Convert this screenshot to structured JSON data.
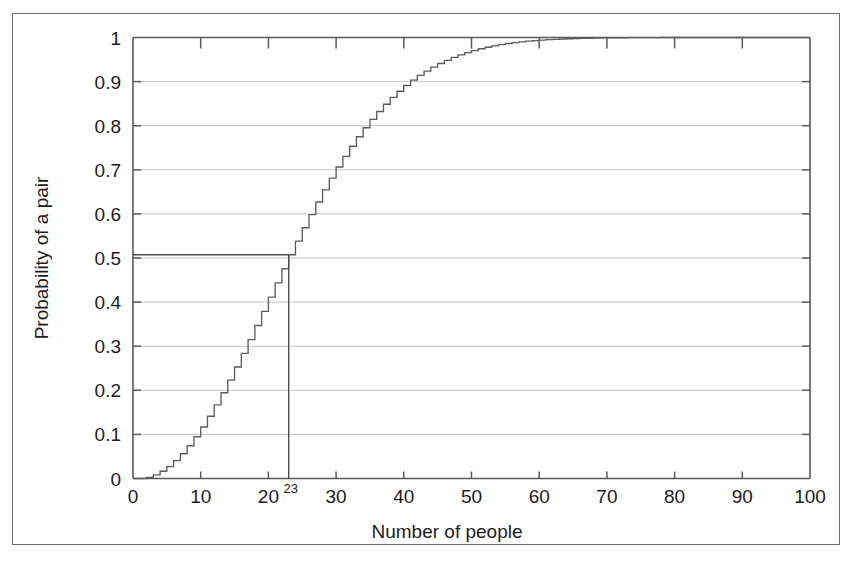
{
  "figure": {
    "frame_border_color": "#6b6b6b",
    "background_color": "#ffffff",
    "axis_color": "#5a5a5a",
    "grid_color": "#b9b9b9",
    "curve_color": "#5d5d5d"
  },
  "chart_data": {
    "type": "line",
    "title": "",
    "xlabel": "Number of people",
    "ylabel": "Probability of a pair",
    "xlim": [
      0,
      100
    ],
    "ylim": [
      0,
      1
    ],
    "grid": true,
    "legend": false,
    "x_ticks": [
      0,
      10,
      20,
      30,
      40,
      50,
      60,
      70,
      80,
      90,
      100
    ],
    "x_tick_labels": [
      "0",
      "10",
      "20",
      "30",
      "40",
      "50",
      "60",
      "70",
      "80",
      "90",
      "100"
    ],
    "y_ticks": [
      0,
      0.1,
      0.2,
      0.3,
      0.4,
      0.5,
      0.6,
      0.7,
      0.8,
      0.9,
      1
    ],
    "y_tick_labels": [
      "0",
      "0.1",
      "0.2",
      "0.3",
      "0.4",
      "0.5",
      "0.6",
      "0.7",
      "0.8",
      "0.9",
      "1"
    ],
    "step_style": "post",
    "annotations": [
      {
        "name": "birthday-threshold",
        "label": "23",
        "x": 23,
        "y": 0.5073,
        "vline": true,
        "hline": true,
        "description": "Vertical line at 23 people and horizontal line at probability 0.507"
      }
    ],
    "x": [
      0,
      1,
      2,
      3,
      4,
      5,
      6,
      7,
      8,
      9,
      10,
      11,
      12,
      13,
      14,
      15,
      16,
      17,
      18,
      19,
      20,
      21,
      22,
      23,
      24,
      25,
      26,
      27,
      28,
      29,
      30,
      31,
      32,
      33,
      34,
      35,
      36,
      37,
      38,
      39,
      40,
      41,
      42,
      43,
      44,
      45,
      46,
      47,
      48,
      49,
      50,
      51,
      52,
      53,
      54,
      55,
      56,
      57,
      58,
      59,
      60,
      61,
      62,
      63,
      64,
      65,
      66,
      67,
      68,
      69,
      70,
      71,
      72,
      73,
      74,
      75,
      76,
      77,
      78,
      79,
      80,
      81,
      82,
      83,
      84,
      85,
      86,
      87,
      88,
      89,
      90,
      91,
      92,
      93,
      94,
      95,
      96,
      97,
      98,
      99,
      100
    ],
    "y": [
      0,
      0,
      0.0027,
      0.0082,
      0.0164,
      0.0271,
      0.0405,
      0.0562,
      0.0743,
      0.0946,
      0.1169,
      0.1411,
      0.167,
      0.1944,
      0.2231,
      0.2529,
      0.2836,
      0.315,
      0.3469,
      0.3791,
      0.4114,
      0.4437,
      0.4757,
      0.5073,
      0.5383,
      0.5687,
      0.5982,
      0.6269,
      0.6545,
      0.681,
      0.7063,
      0.7305,
      0.7533,
      0.775,
      0.7953,
      0.8144,
      0.8322,
      0.8487,
      0.8641,
      0.8782,
      0.8912,
      0.9032,
      0.914,
      0.9239,
      0.9329,
      0.941,
      0.9483,
      0.9548,
      0.9606,
      0.9658,
      0.9704,
      0.9744,
      0.978,
      0.9811,
      0.9839,
      0.9863,
      0.9883,
      0.9901,
      0.9917,
      0.993,
      0.9941,
      0.9951,
      0.9959,
      0.9966,
      0.9972,
      0.9977,
      0.9981,
      0.9984,
      0.9987,
      0.999,
      0.9992,
      0.9993,
      0.9995,
      0.9996,
      0.9997,
      0.9997,
      0.9998,
      0.9998,
      0.9999,
      0.9999,
      0.9999,
      0.9999,
      1,
      1,
      1,
      1,
      1,
      1,
      1,
      1,
      1,
      1,
      1,
      1,
      1,
      1,
      1,
      1,
      1,
      1
    ]
  }
}
